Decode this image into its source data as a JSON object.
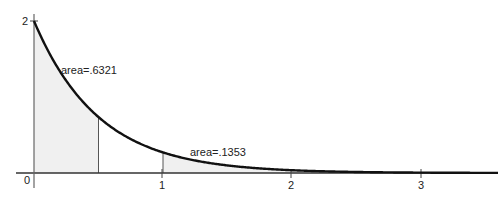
{
  "chart_data": {
    "type": "area",
    "title": "",
    "function": "f(x) = 2e^(-2x)",
    "xlabel": "",
    "ylabel": "",
    "xlim": [
      0,
      3.6
    ],
    "ylim": [
      0,
      2
    ],
    "x_ticks": [
      0,
      1,
      2,
      3
    ],
    "x_tick_labels": [
      "0",
      "1",
      "2",
      "3"
    ],
    "y_ticks": [
      2
    ],
    "y_tick_labels": [
      "2"
    ],
    "grid": false,
    "curve": {
      "x": [
        0,
        0.25,
        0.5,
        0.75,
        1,
        1.5,
        2,
        2.5,
        3,
        3.5
      ],
      "y": [
        2,
        1.2131,
        0.7358,
        0.4463,
        0.2707,
        0.0996,
        0.0366,
        0.0135,
        0.005,
        0.0018
      ]
    },
    "shaded_regions": [
      {
        "from": 0,
        "to": 0.5,
        "label": "area=.6321",
        "area": 0.6321
      },
      {
        "from": 1,
        "to": 3.6,
        "label": "area=.1353",
        "area": 0.1353
      }
    ],
    "annotations": [
      "area=.6321",
      "area=.1353"
    ]
  },
  "labels": {
    "area1": "area=.6321",
    "area2": "area=.1353",
    "x0": "0",
    "x1": "1",
    "x2": "2",
    "x3": "3",
    "y2": "2"
  },
  "colors": {
    "curve": "#111111",
    "axis": "#333333",
    "shade": "#f0f0f0"
  }
}
